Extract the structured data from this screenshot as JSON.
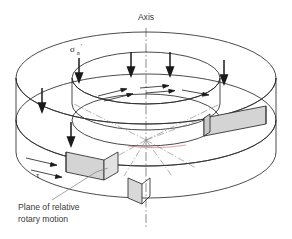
{
  "figure": {
    "type": "technical-diagram",
    "background_color": "#ffffff",
    "line_color": "#2b2b2b",
    "shade_color": "#d4d4d4",
    "text_color": "#3a3a3a",
    "accent_color": "#c0504d"
  },
  "labels": {
    "axis": "Axis",
    "normal_stress_symbol": "σ",
    "normal_stress_subscript": "n",
    "normal_stress_prime": "'",
    "shear_stress_symbol": "τ",
    "plane_caption_line1": "Plane of relative",
    "plane_caption_line2": "rotary motion"
  },
  "annotations": {
    "load_arrow_count": 6,
    "shear_arrow_count": 7,
    "shaded_block_count": 3,
    "axis_line_style": "dash-dot",
    "radial_line_style": "dash-dot"
  }
}
